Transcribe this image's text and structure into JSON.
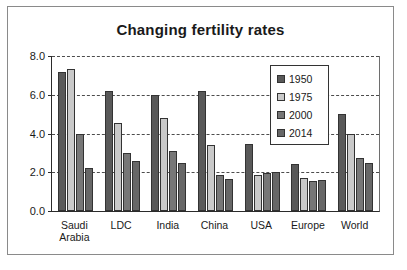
{
  "chart_data": {
    "type": "bar",
    "title": "Changing fertility rates",
    "xlabel": "",
    "ylabel": "",
    "ylim": [
      0,
      8
    ],
    "yticks": [
      "0.0",
      "2.0",
      "4.0",
      "6.0",
      "8.0"
    ],
    "grid": true,
    "legend_position": "inside-right",
    "categories": [
      "Saudi Arabia",
      "LDC",
      "India",
      "China",
      "USA",
      "Europe",
      "World"
    ],
    "series": [
      {
        "name": "1950",
        "color": "#595959",
        "values": [
          7.2,
          6.2,
          6.0,
          6.2,
          3.45,
          2.45,
          5.0
        ]
      },
      {
        "name": "1975",
        "color": "#c9c9c9",
        "values": [
          7.35,
          4.55,
          4.8,
          3.4,
          1.88,
          1.7,
          4.0
        ]
      },
      {
        "name": "2000",
        "color": "#777777",
        "values": [
          4.0,
          3.0,
          3.1,
          1.85,
          1.95,
          1.55,
          2.75
        ]
      },
      {
        "name": "2014",
        "color": "#676767",
        "values": [
          2.2,
          2.6,
          2.5,
          1.65,
          2.0,
          1.6,
          2.5
        ]
      }
    ]
  }
}
